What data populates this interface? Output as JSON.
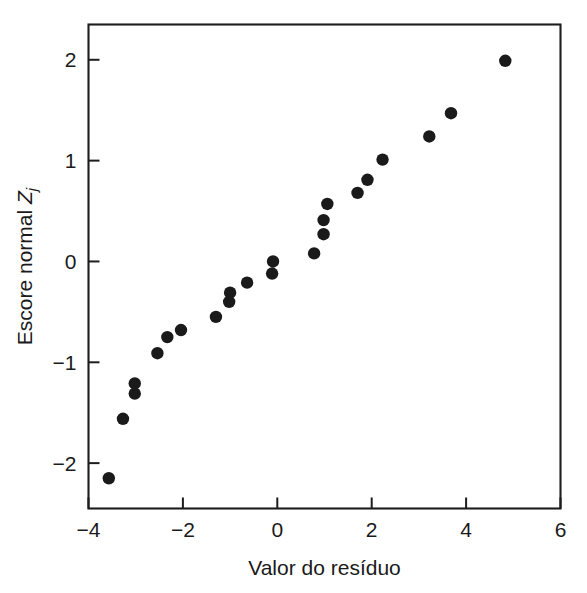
{
  "figure": {
    "background_color": "#ffffff",
    "marker_color": "#1a1a1a",
    "axis_color": "#1d1d1d"
  },
  "chart_data": {
    "type": "scatter",
    "title": "",
    "xlabel": "Valor do resíduo",
    "ylabel_prefix": "Escore normal ",
    "ylabel_symbol": "Z",
    "ylabel_subscript": "j",
    "ylabel": "Escore normal Zj",
    "xlim": [
      -4,
      6
    ],
    "ylim": [
      -2.45,
      2.35
    ],
    "xticks": [
      -4,
      -2,
      0,
      2,
      4,
      6
    ],
    "xticklabels": [
      "−4",
      "−2",
      "0",
      "2",
      "4",
      "6"
    ],
    "yticks": [
      2,
      1,
      0,
      -1,
      -2
    ],
    "yticklabels": [
      "2",
      "1",
      "0",
      "−1",
      "−2"
    ],
    "grid": false,
    "legend": false,
    "marker_radius_px": 6.2,
    "n_points": 24,
    "x": [
      -3.57,
      -3.27,
      -3.02,
      -3.02,
      -2.54,
      -2.33,
      -2.04,
      -1.3,
      -1.02,
      -1.0,
      -0.64,
      -0.11,
      -0.09,
      0.78,
      0.98,
      0.98,
      1.06,
      1.7,
      1.91,
      2.23,
      3.22,
      3.68,
      4.83,
      -0.09
    ],
    "y": [
      -2.15,
      -1.56,
      -1.31,
      -1.21,
      -0.91,
      -0.75,
      -0.68,
      -0.55,
      -0.4,
      -0.31,
      -0.21,
      -0.12,
      0.0,
      0.08,
      0.27,
      0.41,
      0.57,
      0.68,
      0.81,
      1.01,
      1.24,
      1.47,
      1.99,
      -0.12
    ],
    "points": [
      {
        "x": -3.57,
        "y": -2.15
      },
      {
        "x": -3.27,
        "y": -1.56
      },
      {
        "x": -3.02,
        "y": -1.31
      },
      {
        "x": -3.02,
        "y": -1.21
      },
      {
        "x": -2.54,
        "y": -0.91
      },
      {
        "x": -2.33,
        "y": -0.75
      },
      {
        "x": -2.04,
        "y": -0.68
      },
      {
        "x": -1.3,
        "y": -0.55
      },
      {
        "x": -1.02,
        "y": -0.4
      },
      {
        "x": -1.0,
        "y": -0.31
      },
      {
        "x": -0.64,
        "y": -0.21
      },
      {
        "x": -0.11,
        "y": -0.12
      },
      {
        "x": -0.09,
        "y": 0.0
      },
      {
        "x": 0.78,
        "y": 0.08
      },
      {
        "x": 0.98,
        "y": 0.27
      },
      {
        "x": 0.98,
        "y": 0.41
      },
      {
        "x": 1.06,
        "y": 0.57
      },
      {
        "x": 1.7,
        "y": 0.68
      },
      {
        "x": 1.91,
        "y": 0.81
      },
      {
        "x": 2.23,
        "y": 1.01
      },
      {
        "x": 3.22,
        "y": 1.24
      },
      {
        "x": 3.68,
        "y": 1.47
      },
      {
        "x": 4.83,
        "y": 1.99
      }
    ]
  }
}
